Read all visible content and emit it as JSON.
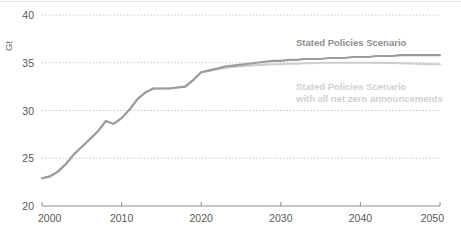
{
  "chart_data": {
    "type": "line",
    "title": "",
    "subtitle": "",
    "xlabel": "",
    "ylabel": "Gt",
    "unit_label": "Gt",
    "xlim": [
      2000,
      2050
    ],
    "ylim": [
      20,
      40
    ],
    "xticks": [
      2000,
      2010,
      2020,
      2030,
      2040,
      2050
    ],
    "xtick_labels": [
      "2000",
      "2010",
      "2020",
      "2030",
      "2040",
      "2050"
    ],
    "yticks": [
      20,
      25,
      30,
      35,
      40
    ],
    "ytick_labels": [
      "20",
      "25",
      "30",
      "35",
      "40"
    ],
    "grid": "horizontal-dotted",
    "grid_color": "#bdbdbd",
    "axis_color": "#8c8c8c",
    "legend_position": "inline-annotations",
    "series": [
      {
        "name": "Stated Policies Scenario",
        "color": "#9b9b9b",
        "label_x": 2032,
        "label_y": 37.0,
        "x": [
          2000,
          2001,
          2002,
          2003,
          2004,
          2005,
          2006,
          2007,
          2008,
          2009,
          2010,
          2011,
          2012,
          2013,
          2014,
          2015,
          2016,
          2017,
          2018,
          2019,
          2020,
          2021,
          2022,
          2023,
          2024,
          2025,
          2026,
          2027,
          2028,
          2029,
          2030,
          2031,
          2032,
          2033,
          2034,
          2035,
          2036,
          2037,
          2038,
          2039,
          2040,
          2041,
          2042,
          2043,
          2044,
          2045,
          2046,
          2047,
          2048,
          2049,
          2050
        ],
        "y": [
          22.9,
          23.1,
          23.6,
          24.4,
          25.4,
          26.2,
          27.0,
          27.8,
          28.9,
          28.6,
          29.2,
          30.1,
          31.2,
          31.9,
          32.3,
          32.3,
          32.3,
          32.4,
          32.5,
          33.2,
          34.0,
          34.2,
          34.4,
          34.6,
          34.7,
          34.8,
          34.9,
          35.0,
          35.1,
          35.2,
          35.2,
          35.3,
          35.3,
          35.4,
          35.4,
          35.4,
          35.5,
          35.5,
          35.5,
          35.6,
          35.6,
          35.6,
          35.7,
          35.7,
          35.7,
          35.8,
          35.8,
          35.8,
          35.8,
          35.8,
          35.8
        ]
      },
      {
        "name": "Stated Policies Scenario with all net zero announcements",
        "color": "#cdcdcd",
        "label_line1": "Stated Policies Scenario",
        "label_line2": "with all net zero announcements",
        "label_x": 2032,
        "label_y": 31.3,
        "x": [
          2000,
          2001,
          2002,
          2003,
          2004,
          2005,
          2006,
          2007,
          2008,
          2009,
          2010,
          2011,
          2012,
          2013,
          2014,
          2015,
          2016,
          2017,
          2018,
          2019,
          2020,
          2021,
          2022,
          2023,
          2024,
          2025,
          2026,
          2027,
          2028,
          2029,
          2030,
          2031,
          2032,
          2033,
          2034,
          2035,
          2036,
          2037,
          2038,
          2039,
          2040,
          2041,
          2042,
          2043,
          2044,
          2045,
          2046,
          2047,
          2048,
          2049,
          2050
        ],
        "y": [
          22.9,
          23.1,
          23.6,
          24.4,
          25.4,
          26.2,
          27.0,
          27.8,
          28.9,
          28.6,
          29.2,
          30.1,
          31.2,
          31.9,
          32.3,
          32.3,
          32.3,
          32.4,
          32.5,
          33.2,
          34.0,
          34.15,
          34.3,
          34.45,
          34.55,
          34.65,
          34.7,
          34.75,
          34.8,
          34.85,
          34.85,
          34.9,
          34.9,
          34.95,
          34.95,
          35.0,
          35.0,
          35.0,
          35.0,
          35.0,
          35.0,
          35.0,
          35.0,
          34.98,
          34.97,
          34.95,
          34.93,
          34.9,
          34.88,
          34.85,
          34.85
        ]
      }
    ]
  },
  "annotations": {
    "primary_label": "Stated Policies Scenario",
    "secondary_label_line1": "Stated Policies Scenario",
    "secondary_label_line2": "with all net zero announcements"
  }
}
